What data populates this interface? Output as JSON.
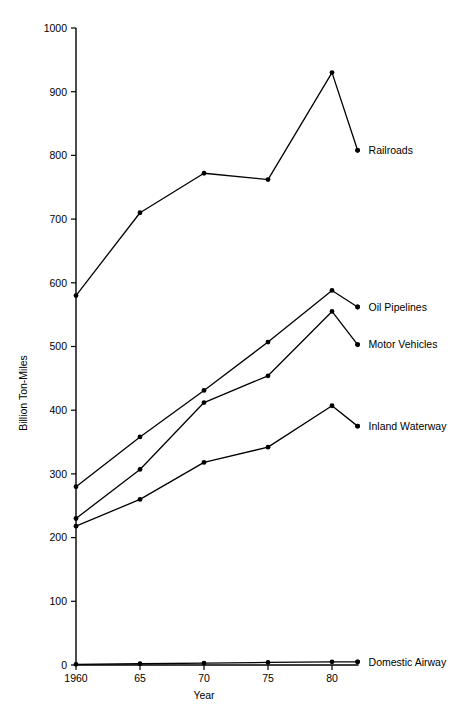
{
  "chart_data": {
    "type": "line",
    "title": "",
    "xlabel": "Year",
    "ylabel": "Billion Ton-Miles",
    "x": [
      1960,
      1965,
      1970,
      1975,
      1980,
      1982
    ],
    "xtick_labels": [
      "1960",
      "65",
      "70",
      "75",
      "80"
    ],
    "xtick_values": [
      1960,
      1965,
      1970,
      1975,
      1980
    ],
    "ytick_labels": [
      "0",
      "100",
      "200",
      "300",
      "400",
      "500",
      "600",
      "700",
      "800",
      "900",
      "1000"
    ],
    "ytick_values": [
      0,
      100,
      200,
      300,
      400,
      500,
      600,
      700,
      800,
      900,
      1000
    ],
    "xlim": [
      1960,
      1983
    ],
    "ylim": [
      0,
      1000
    ],
    "grid": false,
    "legend_position": "right-inline-end-of-line",
    "marker": "filled-circle",
    "line_color": "#000000",
    "series": [
      {
        "name": "Railroads",
        "values": [
          580,
          710,
          772,
          762,
          930,
          808
        ],
        "label_dot_value": 808
      },
      {
        "name": "Oil Pipelines",
        "values": [
          280,
          358,
          431,
          507,
          588,
          562
        ],
        "label_dot_value": 562
      },
      {
        "name": "Motor Vehicles",
        "values": [
          230,
          307,
          412,
          454,
          555,
          503
        ],
        "label_dot_value": 503
      },
      {
        "name": "Inland Waterway",
        "values": [
          218,
          260,
          318,
          342,
          407,
          375
        ],
        "label_dot_value": 375
      },
      {
        "name": "Domestic Airway",
        "values": [
          1,
          2,
          3,
          4,
          5,
          5
        ],
        "label_dot_value": 5
      }
    ]
  }
}
